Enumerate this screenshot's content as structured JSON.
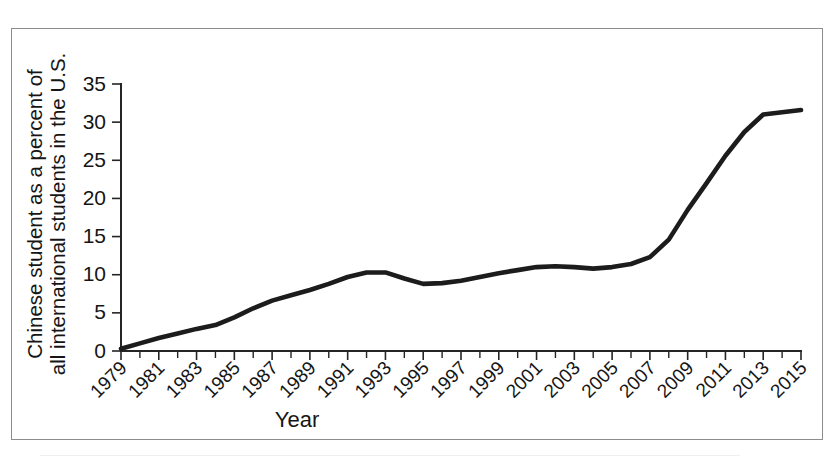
{
  "figure": {
    "frame_border_color": "#8d8d8d",
    "background": "#ffffff"
  },
  "chart_data": {
    "type": "line",
    "title": "",
    "xlabel": "Year",
    "ylabel_line1": "Chinese student as a percent of",
    "ylabel_line2": "all international students in the U.S.",
    "ylabel": "Chinese student as a percent of all international students in the U.S.",
    "series_name": "Chinese students share",
    "line_color": "#1c1c1c",
    "grid": false,
    "legend": "none",
    "ylim": [
      0,
      35
    ],
    "ytick_labels": [
      "0",
      "5",
      "10",
      "15",
      "20",
      "25",
      "30",
      "35"
    ],
    "yticks": [
      0,
      5,
      10,
      15,
      20,
      25,
      30,
      35
    ],
    "xlim": [
      1979,
      2015
    ],
    "xtick_labels": [
      "1979",
      "1981",
      "1983",
      "1985",
      "1987",
      "1989",
      "1991",
      "1993",
      "1995",
      "1997",
      "1999",
      "2001",
      "2003",
      "2005",
      "2007",
      "2009",
      "2011",
      "2013",
      "2015"
    ],
    "x": [
      1979,
      1980,
      1981,
      1982,
      1983,
      1984,
      1985,
      1986,
      1987,
      1988,
      1989,
      1990,
      1991,
      1992,
      1993,
      1994,
      1995,
      1996,
      1997,
      1998,
      1999,
      2000,
      2001,
      2002,
      2003,
      2004,
      2005,
      2006,
      2007,
      2008,
      2009,
      2010,
      2011,
      2012,
      2013,
      2014,
      2015
    ],
    "values": [
      0.3,
      1.0,
      1.7,
      2.3,
      2.9,
      3.4,
      4.4,
      5.6,
      6.6,
      7.3,
      8.0,
      8.8,
      9.7,
      10.3,
      10.3,
      9.5,
      8.8,
      8.9,
      9.2,
      9.7,
      10.2,
      10.6,
      11.0,
      11.1,
      11.0,
      10.8,
      11.0,
      11.4,
      12.3,
      14.6,
      18.5,
      22.0,
      25.6,
      28.7,
      31.0,
      31.3,
      31.6
    ],
    "annotations": []
  }
}
